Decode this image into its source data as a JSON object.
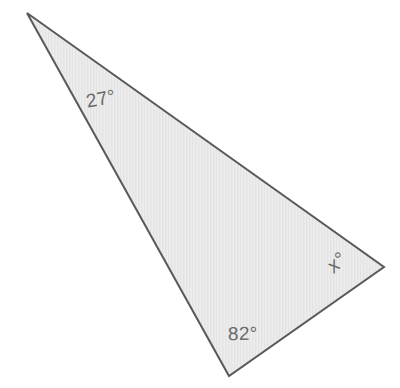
{
  "diagram": {
    "kind": "triangle-angle-diagram",
    "background_color": "#ffffff",
    "shape": {
      "name": "triangle",
      "fill_color": "#e8e8e8",
      "stroke_color": "#595959",
      "stroke_width": 2,
      "vertices": [
        {
          "name": "top-left-vertex",
          "x": 27,
          "y": 13
        },
        {
          "name": "right-vertex",
          "x": 384,
          "y": 267
        },
        {
          "name": "bottom-vertex",
          "x": 229,
          "y": 376
        }
      ]
    },
    "labels": [
      {
        "id": "label-top",
        "name": "angle-label-top-left",
        "text": "27°",
        "value": 27,
        "unit": "degrees",
        "at_vertex": "top-left-vertex",
        "color": "#6b6b6b",
        "rotation_deg": -11,
        "italic": false
      },
      {
        "id": "label-bottom",
        "name": "angle-label-bottom",
        "text": "82°",
        "value": 82,
        "unit": "degrees",
        "at_vertex": "bottom-vertex",
        "color": "#6b6b6b",
        "rotation_deg": -1,
        "italic": false
      },
      {
        "id": "label-right",
        "name": "angle-label-unknown-x",
        "text": "x°",
        "value": "x",
        "unit": "degrees",
        "at_vertex": "right-vertex",
        "color": "#6b6b6b",
        "rotation_deg": -42,
        "italic": true
      }
    ]
  }
}
